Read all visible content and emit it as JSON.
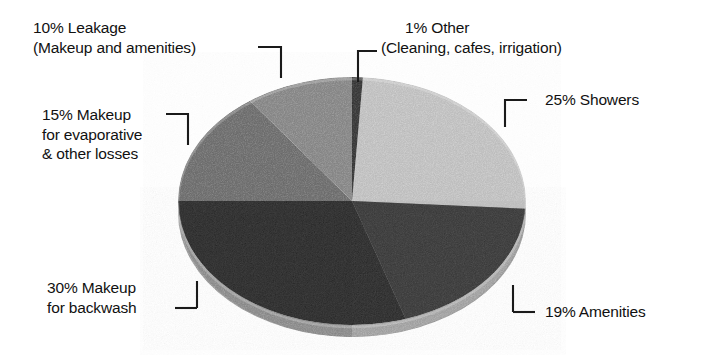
{
  "chart_data": {
    "type": "pie",
    "title": "",
    "subtitle": "",
    "xlabel": "",
    "ylabel": "",
    "grid": false,
    "legend_position": "callout-labels",
    "units": "percent",
    "total": 100,
    "categories": [
      "Other (Cleaning, cafes, irrigation)",
      "Showers",
      "Amenities",
      "Makeup for backwash",
      "Makeup for evaporative & other losses",
      "Leakage (Makeup and amenities)"
    ],
    "values": [
      1,
      25,
      19,
      30,
      15,
      10
    ],
    "slices": [
      {
        "key": "other",
        "percent": 1,
        "percent_text": "1%",
        "label_line1": "1% Other",
        "label_line2": "(Cleaning, cafes, irrigation)",
        "color": "#2b2b2b",
        "start_angle_deg": 0,
        "end_angle_deg": 3.6
      },
      {
        "key": "showers",
        "percent": 25,
        "percent_text": "25%",
        "label_line1": "25% Showers",
        "label_line2": "",
        "color": "#c8c8c8",
        "start_angle_deg": 3.6,
        "end_angle_deg": 93.6
      },
      {
        "key": "amenities",
        "percent": 19,
        "percent_text": "19%",
        "label_line1": "19% Amenities",
        "label_line2": "",
        "color": "#343434",
        "start_angle_deg": 93.6,
        "end_angle_deg": 162.0
      },
      {
        "key": "backwash",
        "percent": 30,
        "percent_text": "30%",
        "label_line1": "30% Makeup",
        "label_line2": "for backwash",
        "color": "#202020",
        "start_angle_deg": 162.0,
        "end_angle_deg": 270.0
      },
      {
        "key": "evaporative",
        "percent": 15,
        "percent_text": "15%",
        "label_line1": "15% Makeup",
        "label_line2": "for evaporative",
        "label_line3": "& other losses",
        "color": "#6e6e6e",
        "start_angle_deg": 270.0,
        "end_angle_deg": 324.0
      },
      {
        "key": "leakage",
        "percent": 10,
        "percent_text": "10%",
        "label_line1": "10% Leakage",
        "label_line2": "(Makeup and amenities)",
        "color": "#8a8a8a",
        "start_angle_deg": 324.0,
        "end_angle_deg": 360.0
      }
    ]
  },
  "colors": {
    "background": "#ffffff",
    "text": "#111111",
    "leader_line": "#1a1a1a",
    "pie_depth_shadow": "#9b9b9b"
  }
}
